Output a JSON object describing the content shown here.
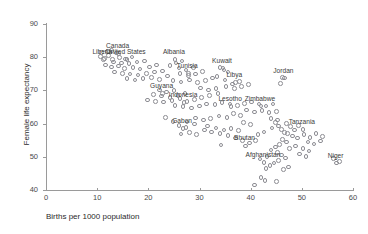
{
  "chart_data": {
    "type": "scatter",
    "title": "",
    "xlabel": "Births per 1000 population",
    "ylabel": "Female life expectancy",
    "xlim": [
      0,
      60
    ],
    "ylim": [
      40,
      90
    ],
    "xticks": [
      0,
      10,
      20,
      30,
      40,
      50,
      60
    ],
    "yticks": [
      40,
      50,
      60,
      70,
      80,
      90
    ],
    "grid": false,
    "legend": null,
    "marker": "open-circle",
    "marker_color": "#8d8d93",
    "annotations": [
      {
        "label": "Canada",
        "x": 14.0,
        "y": 81.5
      },
      {
        "label": "Liberia",
        "x": 11.0,
        "y": 79.6
      },
      {
        "label": "United States",
        "x": 15.6,
        "y": 79.6
      },
      {
        "label": "Albania",
        "x": 25.0,
        "y": 79.6
      },
      {
        "label": "Kuwait",
        "x": 34.4,
        "y": 77.0
      },
      {
        "label": "Tunisia",
        "x": 27.6,
        "y": 75.4
      },
      {
        "label": "Libya",
        "x": 36.8,
        "y": 72.6
      },
      {
        "label": "Jordan",
        "x": 46.4,
        "y": 74.0
      },
      {
        "label": "Guyana",
        "x": 22.6,
        "y": 69.4
      },
      {
        "label": "Indonesia",
        "x": 26.8,
        "y": 66.6
      },
      {
        "label": "Lesotho",
        "x": 36.0,
        "y": 65.4
      },
      {
        "label": "Zimbabwe",
        "x": 41.8,
        "y": 65.6
      },
      {
        "label": "Tanzania",
        "x": 50.0,
        "y": 58.6
      },
      {
        "label": "Gabon",
        "x": 26.6,
        "y": 58.8
      },
      {
        "label": "Bhutan",
        "x": 38.8,
        "y": 53.6
      },
      {
        "label": "Afghanistan",
        "x": 42.4,
        "y": 48.6
      },
      {
        "label": "Niger",
        "x": 56.6,
        "y": 48.4
      }
    ],
    "points": [
      [
        10.6,
        81.8
      ],
      [
        11.8,
        82.0
      ],
      [
        12.6,
        82.4
      ],
      [
        13.6,
        81.6
      ],
      [
        12.0,
        80.9
      ],
      [
        10.4,
        80.6
      ],
      [
        11.2,
        79.9
      ],
      [
        12.8,
        79.6
      ],
      [
        14.2,
        80.2
      ],
      [
        15.4,
        79.8
      ],
      [
        16.6,
        80.4
      ],
      [
        13.0,
        78.8
      ],
      [
        14.6,
        78.6
      ],
      [
        16.0,
        78.4
      ],
      [
        17.6,
        78.8
      ],
      [
        19.0,
        79.2
      ],
      [
        11.4,
        77.9
      ],
      [
        12.6,
        77.4
      ],
      [
        14.0,
        77.6
      ],
      [
        15.2,
        76.9
      ],
      [
        16.8,
        77.2
      ],
      [
        18.2,
        76.8
      ],
      [
        20.0,
        77.4
      ],
      [
        21.4,
        78.0
      ],
      [
        13.2,
        75.8
      ],
      [
        14.8,
        75.4
      ],
      [
        16.2,
        75.2
      ],
      [
        17.8,
        74.9
      ],
      [
        19.4,
        75.4
      ],
      [
        21.0,
        75.8
      ],
      [
        22.6,
        76.2
      ],
      [
        15.6,
        73.8
      ],
      [
        17.2,
        73.4
      ],
      [
        18.8,
        73.8
      ],
      [
        20.4,
        74.2
      ],
      [
        22.0,
        73.6
      ],
      [
        23.6,
        74.6
      ],
      [
        25.2,
        78.6
      ],
      [
        26.4,
        79.2
      ],
      [
        24.0,
        77.8
      ],
      [
        25.8,
        77.0
      ],
      [
        27.2,
        76.4
      ],
      [
        28.6,
        77.2
      ],
      [
        26.0,
        75.4
      ],
      [
        27.6,
        74.8
      ],
      [
        29.0,
        75.2
      ],
      [
        30.4,
        76.0
      ],
      [
        24.6,
        73.2
      ],
      [
        26.2,
        72.8
      ],
      [
        27.8,
        73.4
      ],
      [
        29.4,
        72.6
      ],
      [
        31.0,
        73.2
      ],
      [
        32.4,
        74.0
      ],
      [
        33.8,
        77.2
      ],
      [
        34.6,
        76.4
      ],
      [
        35.4,
        75.8
      ],
      [
        33.2,
        74.4
      ],
      [
        34.8,
        73.4
      ],
      [
        36.2,
        72.2
      ],
      [
        37.6,
        73.0
      ],
      [
        35.0,
        71.4
      ],
      [
        36.6,
        70.8
      ],
      [
        38.0,
        71.4
      ],
      [
        39.4,
        72.0
      ],
      [
        30.0,
        71.0
      ],
      [
        31.6,
        70.4
      ],
      [
        33.0,
        70.8
      ],
      [
        22.0,
        70.4
      ],
      [
        23.4,
        69.8
      ],
      [
        24.8,
        70.2
      ],
      [
        20.8,
        69.0
      ],
      [
        22.4,
        68.6
      ],
      [
        24.0,
        68.2
      ],
      [
        25.6,
        68.8
      ],
      [
        27.0,
        69.4
      ],
      [
        19.6,
        67.4
      ],
      [
        21.2,
        67.0
      ],
      [
        22.8,
        66.8
      ],
      [
        24.4,
        67.2
      ],
      [
        26.0,
        67.8
      ],
      [
        27.4,
        67.0
      ],
      [
        28.8,
        67.6
      ],
      [
        30.2,
        68.2
      ],
      [
        31.8,
        68.8
      ],
      [
        33.4,
        69.4
      ],
      [
        25.0,
        65.8
      ],
      [
        26.6,
        65.4
      ],
      [
        28.2,
        65.0
      ],
      [
        29.8,
        65.6
      ],
      [
        31.2,
        66.2
      ],
      [
        32.8,
        66.0
      ],
      [
        34.2,
        66.6
      ],
      [
        35.8,
        66.2
      ],
      [
        37.2,
        65.8
      ],
      [
        38.6,
        66.4
      ],
      [
        40.0,
        66.8
      ],
      [
        41.4,
        66.2
      ],
      [
        42.8,
        65.6
      ],
      [
        44.2,
        66.2
      ],
      [
        46.0,
        74.2
      ],
      [
        45.6,
        72.4
      ],
      [
        39.0,
        64.4
      ],
      [
        40.6,
        63.8
      ],
      [
        42.0,
        64.2
      ],
      [
        43.4,
        63.6
      ],
      [
        44.8,
        64.0
      ],
      [
        36.4,
        63.4
      ],
      [
        37.8,
        62.8
      ],
      [
        35.2,
        62.2
      ],
      [
        33.6,
        62.6
      ],
      [
        29.0,
        62.0
      ],
      [
        30.6,
        61.4
      ],
      [
        32.0,
        61.8
      ],
      [
        27.4,
        60.8
      ],
      [
        28.8,
        60.2
      ],
      [
        25.8,
        59.8
      ],
      [
        27.2,
        59.2
      ],
      [
        24.6,
        61.0
      ],
      [
        23.2,
        62.2
      ],
      [
        31.4,
        59.6
      ],
      [
        33.0,
        59.0
      ],
      [
        34.6,
        58.4
      ],
      [
        36.0,
        58.8
      ],
      [
        37.4,
        58.2
      ],
      [
        43.8,
        61.8
      ],
      [
        44.6,
        60.6
      ],
      [
        45.2,
        59.6
      ],
      [
        45.8,
        58.6
      ],
      [
        46.4,
        57.6
      ],
      [
        45.0,
        61.4
      ],
      [
        44.0,
        59.0
      ],
      [
        46.8,
        60.4
      ],
      [
        47.6,
        59.4
      ],
      [
        48.4,
        58.4
      ],
      [
        49.2,
        59.8
      ],
      [
        47.0,
        57.4
      ],
      [
        48.0,
        56.6
      ],
      [
        49.0,
        56.0
      ],
      [
        50.2,
        57.0
      ],
      [
        51.4,
        56.2
      ],
      [
        52.6,
        57.4
      ],
      [
        53.8,
        56.4
      ],
      [
        51.0,
        54.8
      ],
      [
        52.2,
        54.2
      ],
      [
        53.4,
        55.0
      ],
      [
        46.0,
        55.6
      ],
      [
        46.8,
        54.8
      ],
      [
        45.4,
        54.0
      ],
      [
        44.6,
        53.2
      ],
      [
        43.8,
        52.4
      ],
      [
        45.0,
        51.6
      ],
      [
        45.8,
        50.8
      ],
      [
        46.6,
        50.0
      ],
      [
        45.2,
        49.2
      ],
      [
        44.4,
        48.4
      ],
      [
        43.6,
        47.6
      ],
      [
        42.8,
        46.8
      ],
      [
        41.8,
        44.0
      ],
      [
        42.6,
        43.2
      ],
      [
        40.6,
        41.8
      ],
      [
        44.8,
        42.8
      ],
      [
        47.4,
        52.8
      ],
      [
        48.6,
        53.6
      ],
      [
        50.0,
        52.8
      ],
      [
        51.2,
        52.0
      ],
      [
        49.4,
        51.2
      ],
      [
        50.6,
        50.4
      ],
      [
        38.2,
        55.2
      ],
      [
        39.6,
        54.4
      ],
      [
        40.8,
        55.2
      ],
      [
        36.8,
        56.0
      ],
      [
        35.4,
        56.8
      ],
      [
        33.8,
        57.4
      ],
      [
        32.2,
        57.8
      ],
      [
        30.8,
        58.4
      ],
      [
        29.2,
        57.0
      ],
      [
        27.8,
        57.6
      ],
      [
        26.2,
        57.2
      ],
      [
        57.2,
        48.8
      ],
      [
        56.0,
        49.8
      ],
      [
        41.2,
        57.0
      ],
      [
        42.4,
        57.8
      ],
      [
        39.8,
        60.0
      ],
      [
        38.4,
        60.6
      ],
      [
        34.0,
        53.8
      ],
      [
        41.6,
        49.6
      ],
      [
        43.0,
        50.4
      ],
      [
        47.2,
        47.2
      ],
      [
        46.2,
        46.4
      ]
    ]
  }
}
